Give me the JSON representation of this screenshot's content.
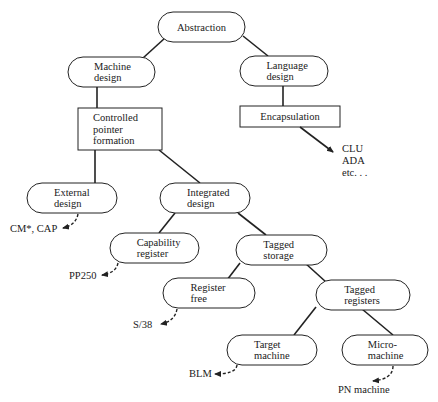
{
  "nodes": {
    "abstraction": {
      "label": [
        "Abstraction"
      ],
      "shape": "pill"
    },
    "machine_design": {
      "label": [
        "Machine",
        "design"
      ],
      "shape": "pill"
    },
    "language_design": {
      "label": [
        "Language",
        "design"
      ],
      "shape": "pill"
    },
    "controlled_pointer": {
      "label": [
        "Controlled",
        "pointer",
        "formation"
      ],
      "shape": "rect"
    },
    "encapsulation": {
      "label": [
        "Encapsulation"
      ],
      "shape": "rect"
    },
    "external_design": {
      "label": [
        "External",
        "design"
      ],
      "shape": "pill"
    },
    "integrated_design": {
      "label": [
        "Integrated",
        "design"
      ],
      "shape": "pill"
    },
    "capability_register": {
      "label": [
        "Capability",
        "register"
      ],
      "shape": "pill"
    },
    "tagged_storage": {
      "label": [
        "Tagged",
        "storage"
      ],
      "shape": "pill"
    },
    "register_free": {
      "label": [
        "Register",
        "free"
      ],
      "shape": "pill"
    },
    "tagged_registers": {
      "label": [
        "Tagged",
        "registers"
      ],
      "shape": "pill"
    },
    "target_machine": {
      "label": [
        "Target",
        "machine"
      ],
      "shape": "pill"
    },
    "micro_machine": {
      "label": [
        "Micro-",
        "machine"
      ],
      "shape": "pill"
    }
  },
  "edges": [
    [
      "abstraction",
      "machine_design"
    ],
    [
      "abstraction",
      "language_design"
    ],
    [
      "machine_design",
      "controlled_pointer"
    ],
    [
      "language_design",
      "encapsulation"
    ],
    [
      "controlled_pointer",
      "external_design"
    ],
    [
      "controlled_pointer",
      "integrated_design"
    ],
    [
      "integrated_design",
      "capability_register"
    ],
    [
      "integrated_design",
      "tagged_storage"
    ],
    [
      "tagged_storage",
      "register_free"
    ],
    [
      "tagged_storage",
      "tagged_registers"
    ],
    [
      "tagged_registers",
      "target_machine"
    ],
    [
      "tagged_registers",
      "micro_machine"
    ]
  ],
  "examples": {
    "encapsulation": {
      "lines": [
        "CLU",
        "ADA",
        "etc. . ."
      ],
      "arrow": "solid"
    },
    "external_design": {
      "lines": [
        "CM*, CAP"
      ],
      "arrow": "dashed"
    },
    "capability_register": {
      "lines": [
        "PP250"
      ],
      "arrow": "dashed"
    },
    "register_free": {
      "lines": [
        "S/38"
      ],
      "arrow": "dashed"
    },
    "target_machine": {
      "lines": [
        "BLM"
      ],
      "arrow": "dashed"
    },
    "micro_machine": {
      "lines": [
        "PN machine"
      ],
      "arrow": "dashed"
    }
  }
}
